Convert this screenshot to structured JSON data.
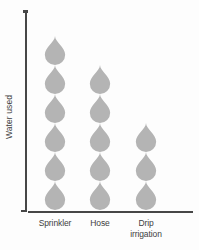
{
  "chart_data": {
    "type": "bar",
    "subtype": "pictograph",
    "title": "",
    "xlabel": "",
    "ylabel": "Water used",
    "categories": [
      "Sprinkler",
      "Hose",
      "Drip irrigation"
    ],
    "values": [
      6,
      5,
      3
    ],
    "unit": "1 water drop icon = 1 unit of water",
    "ylim": [
      0,
      6
    ],
    "grid": false,
    "legend_position": "none",
    "icon": "water-drop-icon",
    "icon_color": "#b4b4b4",
    "axis_color": "#474747",
    "label_color": "#3d3d3d"
  }
}
